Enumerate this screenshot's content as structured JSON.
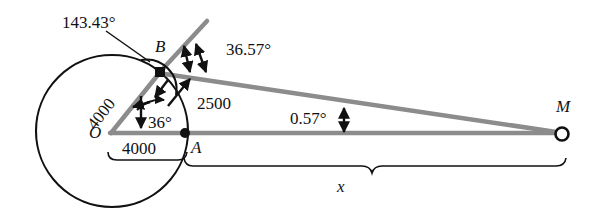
{
  "figure": {
    "colors": {
      "line_gray": "#8c8c8c",
      "stroke_black": "#111111",
      "background": "#ffffff"
    },
    "points": [
      {
        "id": "O",
        "label": "O",
        "x": 112,
        "y": 133,
        "marker": "none"
      },
      {
        "id": "A",
        "label": "A",
        "x": 185,
        "y": 133,
        "marker": "filled-dot"
      },
      {
        "id": "B",
        "label": "B",
        "x": 160,
        "y": 72,
        "marker": "filled-square"
      },
      {
        "id": "M",
        "label": "M",
        "x": 562,
        "y": 133,
        "marker": "open-circle"
      }
    ],
    "angle_labels": [
      {
        "id": "angle-143",
        "text": "143.43°",
        "x": 62,
        "y": 18
      },
      {
        "id": "angle-3657",
        "text": "36.57°",
        "x": 226,
        "y": 45
      },
      {
        "id": "angle-36",
        "text": "36°",
        "x": 146,
        "y": 120
      },
      {
        "id": "angle-057",
        "text": "0.57°",
        "x": 294,
        "y": 115
      }
    ],
    "length_labels": [
      {
        "id": "len-ob",
        "text": "4000",
        "x": 84,
        "y": 118,
        "rotation": -55
      },
      {
        "id": "len-oa",
        "text": "4000",
        "x": 122,
        "y": 145
      },
      {
        "id": "len-ba",
        "text": "2500",
        "x": 197,
        "y": 100
      },
      {
        "id": "len-x",
        "text": "x",
        "x": 337,
        "y": 182
      }
    ],
    "circle": {
      "cx": 112,
      "cy": 131,
      "r": 76
    },
    "segments": [
      {
        "id": "seg-O-A-baseline",
        "from": [
          112,
          133
        ],
        "to": [
          562,
          133
        ],
        "color": "#8c8c8c",
        "width": 4
      },
      {
        "id": "seg-O-B",
        "from": [
          112,
          133
        ],
        "to": [
          160,
          72
        ],
        "color": "#8c8c8c",
        "width": 4
      },
      {
        "id": "seg-B-M",
        "from": [
          160,
          72
        ],
        "to": [
          562,
          133
        ],
        "color": "#8c8c8c",
        "width": 4
      },
      {
        "id": "seg-B-ray-up",
        "from": [
          160,
          72
        ],
        "to": [
          206,
          22
        ],
        "color": "#8c8c8c",
        "width": 4
      }
    ],
    "braces": [
      {
        "id": "brace-4000",
        "x1": 108,
        "x2": 186,
        "y": 159
      },
      {
        "id": "brace-x",
        "x1": 184,
        "x2": 566,
        "y": 166
      }
    ]
  }
}
